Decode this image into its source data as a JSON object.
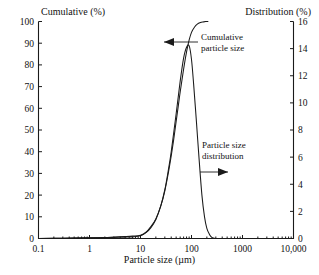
{
  "figure": {
    "left_axis_title": "Cumulative (%)",
    "right_axis_title": "Distribution (%)",
    "x_axis_title": "Particle size (µm)"
  },
  "annotations": {
    "cumulative_line1": "Cumulative",
    "cumulative_line2": "particle size",
    "distribution_line1": "Particle size",
    "distribution_line2": "distribution"
  },
  "chart_data": {
    "type": "line",
    "title": "",
    "xlabel": "Particle size (µm)",
    "ylabel": "Cumulative (%)",
    "y2label": "Distribution (%)",
    "xscale": "log",
    "xlim": [
      0.1,
      10000
    ],
    "ylim": [
      0,
      100
    ],
    "y2lim": [
      0,
      16
    ],
    "grid": false,
    "legend": "annotations",
    "xticks": [
      "0.1",
      "1",
      "10",
      "100",
      "1000",
      "10,000"
    ],
    "xtick_values": [
      0.1,
      1,
      10,
      100,
      1000,
      10000
    ],
    "yticks": [
      "0",
      "10",
      "20",
      "30",
      "40",
      "50",
      "60",
      "70",
      "80",
      "90",
      "100"
    ],
    "ytick_values": [
      0,
      10,
      20,
      30,
      40,
      50,
      60,
      70,
      80,
      90,
      100
    ],
    "y2ticks": [
      "0",
      "2",
      "4",
      "6",
      "8",
      "10",
      "12",
      "14",
      "16"
    ],
    "y2tick_values": [
      0,
      2,
      4,
      6,
      8,
      10,
      12,
      14,
      16
    ],
    "series": [
      {
        "name": "Cumulative particle size",
        "axis": "left",
        "x": [
          0.1,
          0.3,
          1,
          2,
          3,
          5,
          7,
          10,
          13,
          16,
          20,
          25,
          30,
          35,
          40,
          45,
          50,
          55,
          60,
          70,
          80,
          90,
          100,
          115,
          130,
          150,
          170,
          190,
          210
        ],
        "y": [
          0,
          0.1,
          0.3,
          0.5,
          0.7,
          0.9,
          1.1,
          1.5,
          3.0,
          5.5,
          9.0,
          15.0,
          22.0,
          30.0,
          38.0,
          46.0,
          54.0,
          61.0,
          67.5,
          78.0,
          86.0,
          91.5,
          95.0,
          97.5,
          98.8,
          99.5,
          99.8,
          100,
          100
        ]
      },
      {
        "name": "Particle size distribution",
        "axis": "right",
        "x": [
          0.1,
          0.3,
          1,
          2,
          3,
          5,
          7,
          10,
          13,
          16,
          20,
          25,
          30,
          35,
          40,
          50,
          60,
          70,
          80,
          90,
          100,
          110,
          125,
          140,
          160,
          180,
          200,
          225,
          250,
          275,
          300,
          400,
          1000,
          10000
        ],
        "y": [
          0,
          0.02,
          0.05,
          0.07,
          0.08,
          0.1,
          0.12,
          0.2,
          0.45,
          0.8,
          1.4,
          2.4,
          3.6,
          5.0,
          6.4,
          9.2,
          11.6,
          13.3,
          14.1,
          14.2,
          13.2,
          11.4,
          8.6,
          6.0,
          3.2,
          1.6,
          0.75,
          0.3,
          0.08,
          0.02,
          0,
          0,
          0,
          0
        ]
      }
    ]
  }
}
